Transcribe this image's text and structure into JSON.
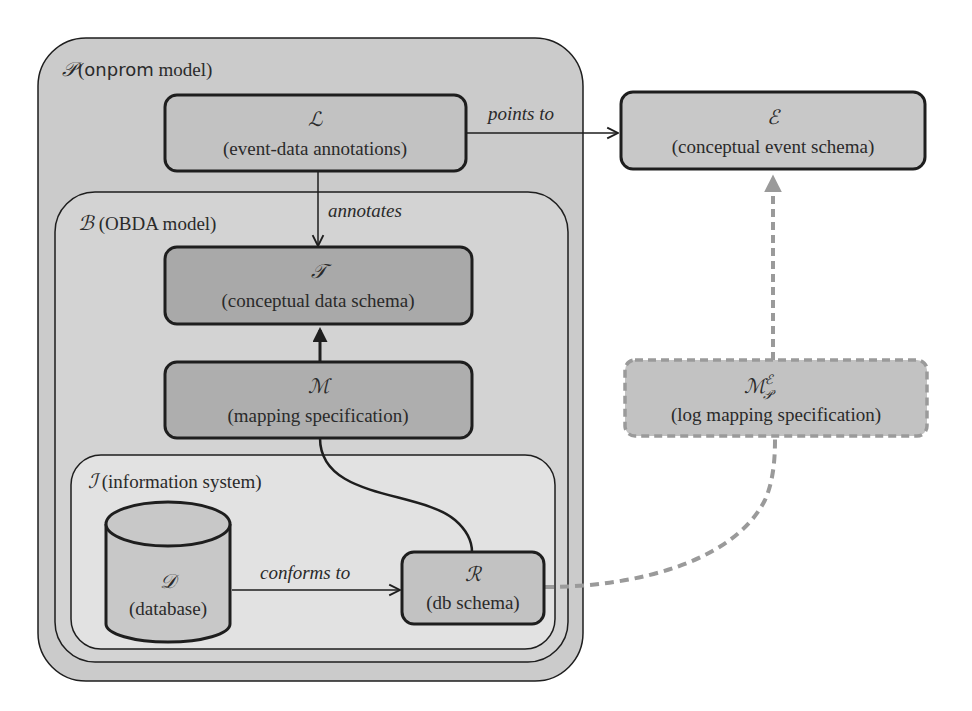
{
  "diagram": {
    "colors": {
      "outer_fill": "#cbcbcb",
      "inner_fill": "#d3d3d3",
      "info_fill": "#e2e2e2",
      "box_fill": "#c2c2c2",
      "dark_box_fill": "#a9a9a9",
      "stroke": "#1e1e1e",
      "dashed": "#9a9a9a"
    },
    "containers": {
      "onprom": {
        "symbol": "𝒫",
        "label": " (onprom model)",
        "label_word": "onprom",
        "label_rest": " model)"
      },
      "obda": {
        "symbol": "ℬ",
        "label": " (OBDA model)"
      },
      "info_system": {
        "symbol": "ℐ",
        "label": " (information system)"
      }
    },
    "nodes": {
      "L": {
        "symbol": "ℒ",
        "label": "(event-data annotations)"
      },
      "E": {
        "symbol": "ℰ",
        "label": "(conceptual event schema)"
      },
      "T": {
        "symbol": "𝒯",
        "label": "(conceptual data schema)"
      },
      "M": {
        "symbol": "ℳ",
        "label": "(mapping specification)"
      },
      "MPE": {
        "symbol": "ℳ",
        "sup": "ℰ",
        "sub": "𝒫",
        "label": "(log mapping specification)"
      },
      "D": {
        "symbol": "𝒟",
        "label": "(database)"
      },
      "R": {
        "symbol": "ℛ",
        "label": "(db schema)"
      }
    },
    "edges": {
      "points_to": "points to",
      "annotates": "annotates",
      "conforms_to": "conforms to"
    }
  }
}
